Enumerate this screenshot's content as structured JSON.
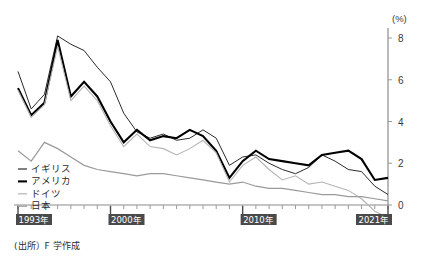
{
  "chart_data": {
    "type": "line",
    "title": "",
    "subtitle": "",
    "xlabel": "",
    "ylabel": "",
    "unit_label": "(%)",
    "source_note": "(出所）F 学作成",
    "grid": false,
    "legend_position": "bottom-left",
    "ylim": [
      -1,
      8.6
    ],
    "yticks": [
      0,
      2,
      4,
      6,
      8
    ],
    "ytick_labels": [
      "0",
      "2",
      "4",
      "6",
      "8"
    ],
    "xlim": [
      1993,
      2021
    ],
    "x": [
      1993,
      1994,
      1995,
      1996,
      1997,
      1998,
      1999,
      2000,
      2001,
      2002,
      2003,
      2004,
      2005,
      2006,
      2007,
      2008,
      2009,
      2010,
      2011,
      2012,
      2013,
      2014,
      2015,
      2016,
      2017,
      2018,
      2019,
      2020,
      2021
    ],
    "xtick_labels": [
      {
        "year": 1993,
        "label": "1993年"
      },
      {
        "year": 2000,
        "label": "2000年"
      },
      {
        "year": 2010,
        "label": "2010年"
      },
      {
        "year": 2021,
        "label": "2021年"
      }
    ],
    "series": [
      {
        "name": "イギリス",
        "color": "#2b2b2b",
        "width": 1.0,
        "values": [
          6.4,
          4.6,
          5.3,
          8.1,
          7.7,
          7.4,
          6.6,
          5.9,
          4.4,
          3.5,
          3.2,
          3.4,
          3.1,
          3.2,
          3.6,
          3.2,
          1.9,
          2.3,
          2.4,
          2.0,
          1.7,
          1.5,
          1.8,
          2.4,
          2.1,
          1.7,
          1.6,
          0.9,
          0.5
        ]
      },
      {
        "name": "アメリカ",
        "color": "#000000",
        "width": 2.1,
        "values": [
          5.6,
          4.3,
          4.9,
          7.9,
          5.2,
          5.9,
          5.2,
          4.0,
          3.0,
          3.6,
          3.1,
          3.3,
          3.2,
          3.6,
          3.3,
          2.6,
          1.3,
          2.1,
          2.6,
          2.2,
          2.1,
          2.0,
          1.9,
          2.4,
          2.5,
          2.6,
          2.2,
          1.2,
          1.3
        ]
      },
      {
        "name": "ドイツ",
        "color": "#b5b5b5",
        "width": 1.1,
        "values": [
          5.5,
          4.2,
          4.8,
          7.6,
          5.0,
          5.7,
          5.0,
          3.8,
          2.8,
          3.4,
          2.8,
          2.7,
          2.4,
          2.7,
          3.1,
          2.5,
          1.1,
          1.9,
          2.3,
          1.7,
          1.2,
          1.4,
          1.0,
          1.1,
          0.9,
          0.7,
          0.3,
          -0.3,
          -0.6
        ]
      },
      {
        "name": "日本",
        "color": "#9a9a9a",
        "width": 1.2,
        "values": [
          2.6,
          2.1,
          3.0,
          2.7,
          2.3,
          1.9,
          1.7,
          1.6,
          1.5,
          1.4,
          1.5,
          1.5,
          1.4,
          1.3,
          1.2,
          1.1,
          1.0,
          1.1,
          0.9,
          0.8,
          0.8,
          0.7,
          0.6,
          0.5,
          0.5,
          0.4,
          0.4,
          0.3,
          0.2
        ]
      }
    ]
  },
  "legend": {
    "items": [
      {
        "label": "イギリス"
      },
      {
        "label": "アメリカ"
      },
      {
        "label": "ドイツ"
      },
      {
        "label": "日本"
      }
    ]
  }
}
